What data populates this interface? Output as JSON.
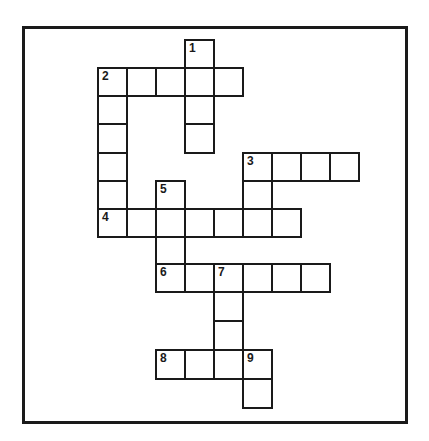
{
  "puzzle": {
    "type": "crossword",
    "grid_origin": {
      "x": 98,
      "y": 40
    },
    "cell_width": 29,
    "row_tops": [
      40,
      68,
      96,
      124,
      153,
      181,
      209,
      237,
      264,
      292,
      321,
      350,
      379,
      408
    ],
    "colors": {
      "line": "#1a1a1a",
      "background": "#ffffff"
    },
    "clue_numbers": [
      "1",
      "2",
      "3",
      "4",
      "5",
      "6",
      "7",
      "8",
      "9"
    ],
    "entries": [
      {
        "number": "1",
        "direction": "down",
        "row": 0,
        "col": 3,
        "length": 4
      },
      {
        "number": "2",
        "direction": "across",
        "row": 1,
        "col": 0,
        "length": 5
      },
      {
        "number": "2",
        "direction": "down",
        "row": 1,
        "col": 0,
        "length": 6
      },
      {
        "number": "3",
        "direction": "across",
        "row": 4,
        "col": 5,
        "length": 4
      },
      {
        "number": "3",
        "direction": "down",
        "row": 4,
        "col": 5,
        "length": 3
      },
      {
        "number": "4",
        "direction": "across",
        "row": 6,
        "col": 0,
        "length": 7
      },
      {
        "number": "5",
        "direction": "down",
        "row": 5,
        "col": 2,
        "length": 4
      },
      {
        "number": "6",
        "direction": "across",
        "row": 8,
        "col": 2,
        "length": 6
      },
      {
        "number": "7",
        "direction": "down",
        "row": 8,
        "col": 4,
        "length": 4
      },
      {
        "number": "8",
        "direction": "across",
        "row": 11,
        "col": 2,
        "length": 4
      },
      {
        "number": "9",
        "direction": "down",
        "row": 11,
        "col": 5,
        "length": 2
      }
    ],
    "cells": [
      {
        "r": 0,
        "c": 3,
        "num": "1"
      },
      {
        "r": 1,
        "c": 0,
        "num": "2"
      },
      {
        "r": 1,
        "c": 1
      },
      {
        "r": 1,
        "c": 2
      },
      {
        "r": 1,
        "c": 3
      },
      {
        "r": 1,
        "c": 4
      },
      {
        "r": 2,
        "c": 0
      },
      {
        "r": 2,
        "c": 3
      },
      {
        "r": 3,
        "c": 0
      },
      {
        "r": 3,
        "c": 3
      },
      {
        "r": 4,
        "c": 0
      },
      {
        "r": 4,
        "c": 5,
        "num": "3"
      },
      {
        "r": 4,
        "c": 6
      },
      {
        "r": 4,
        "c": 7
      },
      {
        "r": 4,
        "c": 8
      },
      {
        "r": 5,
        "c": 0
      },
      {
        "r": 5,
        "c": 2,
        "num": "5"
      },
      {
        "r": 5,
        "c": 5
      },
      {
        "r": 6,
        "c": 0,
        "num": "4"
      },
      {
        "r": 6,
        "c": 1
      },
      {
        "r": 6,
        "c": 2
      },
      {
        "r": 6,
        "c": 3
      },
      {
        "r": 6,
        "c": 4
      },
      {
        "r": 6,
        "c": 5
      },
      {
        "r": 6,
        "c": 6
      },
      {
        "r": 7,
        "c": 2
      },
      {
        "r": 8,
        "c": 2,
        "num": "6"
      },
      {
        "r": 8,
        "c": 3
      },
      {
        "r": 8,
        "c": 4,
        "num": "7"
      },
      {
        "r": 8,
        "c": 5
      },
      {
        "r": 8,
        "c": 6
      },
      {
        "r": 8,
        "c": 7
      },
      {
        "r": 9,
        "c": 4
      },
      {
        "r": 10,
        "c": 4
      },
      {
        "r": 11,
        "c": 2,
        "num": "8"
      },
      {
        "r": 11,
        "c": 3
      },
      {
        "r": 11,
        "c": 4
      },
      {
        "r": 11,
        "c": 5,
        "num": "9"
      },
      {
        "r": 12,
        "c": 5
      }
    ]
  }
}
